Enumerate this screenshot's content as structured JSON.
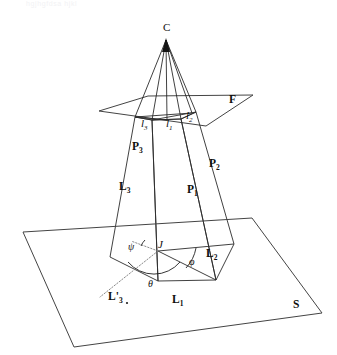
{
  "figure": {
    "caption_faint": "hgjhgfdsa hjkl",
    "background_color": "#ffffff",
    "line_color": "#2b2b2b",
    "dotted_color": "#7a7a7a"
  },
  "labels": {
    "camera_center": "C",
    "focal_plane": "F",
    "scene_plane": "S",
    "junction": "J",
    "image_lines": [
      {
        "base": "l",
        "sub": "3"
      },
      {
        "base": "l",
        "sub": "1"
      },
      {
        "base": "l",
        "sub": "2"
      }
    ],
    "planes": [
      {
        "base": "P",
        "sub": "1"
      },
      {
        "base": "P",
        "sub": "2"
      },
      {
        "base": "P",
        "sub": "3"
      }
    ],
    "scene_lines": [
      {
        "base": "L",
        "sub": "1"
      },
      {
        "base": "L",
        "sub": "2"
      },
      {
        "base": "L",
        "sub": "3"
      },
      {
        "base": "L'",
        "sub": "3"
      }
    ],
    "angles": {
      "phi": "φ",
      "theta": "θ",
      "psi": "ψ"
    }
  }
}
